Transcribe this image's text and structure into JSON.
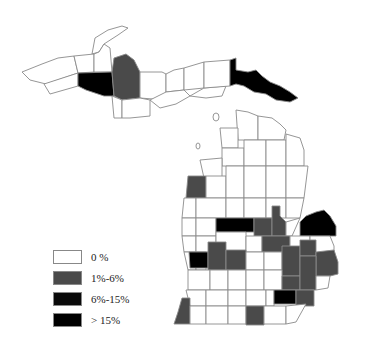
{
  "colors": {
    "zero": "#ffffff",
    "low": "#4a4a4a",
    "mid": "#0a0a0a",
    "high": "#000000",
    "border": "#8a8a8a"
  },
  "legend": {
    "items": [
      {
        "label": "0 %",
        "class": "zero"
      },
      {
        "label": "1%-6%",
        "class": "low"
      },
      {
        "label": "6%-15%",
        "class": "mid"
      },
      {
        "label": "> 15%",
        "class": "high"
      }
    ]
  },
  "map": {
    "region": "Michigan counties",
    "shaded_counties_visible": {
      "upper_peninsula": [
        {
          "position": "western-central",
          "class": "mid"
        },
        {
          "position": "central",
          "class": "low"
        },
        {
          "position": "eastern",
          "class": "high"
        }
      ],
      "lower_peninsula": [
        {
          "position": "west-central lakeshore",
          "class": "low"
        },
        {
          "position": "central",
          "class": "mid"
        },
        {
          "position": "thumb tip",
          "class": "high"
        },
        {
          "position": "west lakeshore",
          "class": "mid"
        },
        {
          "position": "southeast",
          "class": "mid"
        },
        {
          "position": "east-central cluster",
          "class": "low"
        },
        {
          "position": "southwest corner",
          "class": "low"
        },
        {
          "position": "south-central border",
          "class": "low"
        }
      ]
    }
  }
}
